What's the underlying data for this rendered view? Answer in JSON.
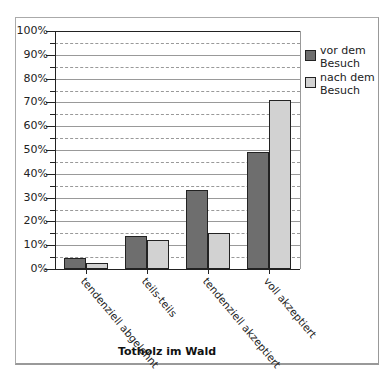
{
  "chart_data": {
    "type": "bar",
    "title": "Totholz im Wald",
    "xlabel": "Totholz im Wald",
    "ylabel": "",
    "ylim": [
      0,
      100
    ],
    "yticks": [
      "0%",
      "10%",
      "20%",
      "30%",
      "40%",
      "50%",
      "60%",
      "70%",
      "80%",
      "90%",
      "100%"
    ],
    "categories": [
      "tendenziell abgelehnt",
      "teils-teils",
      "tendenziell akzeptiert",
      "voll akzeptiert"
    ],
    "series": [
      {
        "name": "vor dem Besuch",
        "color": "#6e6e6e",
        "values": [
          4.5,
          14,
          33,
          49
        ]
      },
      {
        "name": "nach dem Besuch",
        "color": "#d2d2d2",
        "values": [
          2.5,
          12,
          15,
          71
        ]
      }
    ],
    "grid": true,
    "legend_position": "right"
  }
}
